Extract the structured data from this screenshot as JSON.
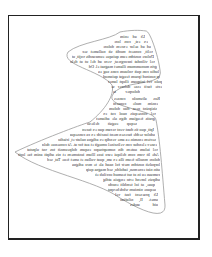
{
  "page": {
    "background": "#ffffff",
    "frame_color": "#222222",
    "outline_color": "#999999",
    "text_color": "#333333",
    "mirrored": true
  },
  "text_block": {
    "lines": [
      {
        "text": "Ut ad enim",
        "x1": 120,
        "x2": 145,
        "y": 34
      },
      {
        "text": "ex est, con lore",
        "x1": 114,
        "x2": 148,
        "y": 39
      },
      {
        "text": "ad ad aelor excem dolore",
        "x1": 103,
        "x2": 151,
        "y": 44
      },
      {
        "text": "velit, consect modit sit nullamet sec",
        "x1": 82,
        "x2": 153,
        "y": 49
      },
      {
        "text": "Dolore nostdm eum quisque eumcandis vojit, ut",
        "x1": 72,
        "x2": 154,
        "y": 54
      },
      {
        "text": "vel vilindat incorgreat, vero ad del ut at delo",
        "x1": 70,
        "x2": 155,
        "y": 59
      },
      {
        "text": "grin monummum illamet magnat el. Od de",
        "x1": 88,
        "x2": 157,
        "y": 64
      },
      {
        "text": "ludio con quit voluum cons sug ea",
        "x1": 98,
        "x2": 159,
        "y": 69
      },
      {
        "text": "ip nostrud ipsum feugat quismod",
        "x1": 103,
        "x2": 160,
        "y": 74
      },
      {
        "text": "pulo vel iniquam illupt lamet",
        "x1": 108,
        "x2": 162,
        "y": 79
      },
      {
        "text": "ecte facit esse dolorer se",
        "x1": 111,
        "x2": 162,
        "y": 84
      },
      {
        "text": "dolorper ia",
        "x1": 113,
        "x2": 140,
        "y": 89
      },
      {
        "text": "Ros alismolo conses",
        "x1": 114,
        "x2": 160,
        "y": 96
      },
      {
        "text": "ensim mole consent",
        "x1": 113,
        "x2": 158,
        "y": 101
      },
      {
        "text": "sisipsint ness duo dolum",
        "x1": 109,
        "x2": 157,
        "y": 106
      },
      {
        "text": "vel consequis nuol cut ex",
        "x1": 103,
        "x2": 156,
        "y": 111
      },
      {
        "text": "gratis feugiam dign ale adiamet",
        "x1": 96,
        "x2": 155,
        "y": 116
      },
      {
        "text": "sequp eugait deliesu",
        "x1": 87,
        "x2": 137,
        "y": 121
      },
      {
        "text": "Ipit, quo tis dunt vent veram quo ex facentem",
        "x1": 82,
        "x2": 154,
        "y": 127
      },
      {
        "text": "adolor sedde facesen ment iuscidc ex ca consequat igni",
        "x1": 70,
        "x2": 155,
        "y": 132
      },
      {
        "text": "sectem ensmin ea ame vendip ex adigna nulutr et, iriadio",
        "x1": 58,
        "x2": 156,
        "y": 137
      },
      {
        "text": "esnev elenduc con veliscinel omugit et aut for at. At consenue dolorbare",
        "x1": 42,
        "x2": 157,
        "y": 142
      },
      {
        "text": "vel iulum autem din nomuptsupo esqum dolpeumsit tos vat ulputat",
        "x1": 27,
        "x2": 158,
        "y": 147
      },
      {
        "text": "Ade lit vom com deliqui esro iuss lllum iustomem et nis adipit anim fae lorit",
        "x1": 18,
        "x2": 159,
        "y": 152
      },
      {
        "text": "dolore mnollo feum illa ex am, quat vullan et amet feue Tat, sed",
        "x1": 47,
        "x2": 160,
        "y": 157
      },
      {
        "text": "lorpulsit nostdm metr fol naad ale te mrz adigna",
        "x1": 72,
        "x2": 160,
        "y": 162
      },
      {
        "text": "atin niat ecnemsn, iadoldo, sed magna quip",
        "x1": 86,
        "x2": 160,
        "y": 167
      },
      {
        "text": "cumsan eu in at sut teamud occilub eiu tp",
        "x1": 95,
        "x2": 160,
        "y": 172
      },
      {
        "text": "adipsis lorend erto enguia atdig",
        "x1": 103,
        "x2": 160,
        "y": 177
      },
      {
        "text": "quae, at iol temblit enodo",
        "x1": 108,
        "x2": 155,
        "y": 182
      },
      {
        "text": "aequoe nimium wbdebexput",
        "x1": 108,
        "x2": 156,
        "y": 187
      },
      {
        "text": "Ut praesent fast vel",
        "x1": 115,
        "x2": 158,
        "y": 192
      },
      {
        "text": "amet. Il, nilafiao",
        "x1": 120,
        "x2": 158,
        "y": 197
      },
      {
        "text": "uid andes",
        "x1": 130,
        "x2": 158,
        "y": 202
      }
    ]
  },
  "shape": {
    "path": "M146,31 C150,31 158,55 160,70 C165,88 120,78 112,96 C108,108 156,110 156,120 C160,140 162,170 165,205 C166,222 140,210 120,198 C95,180 40,172 15,152 C40,140 80,125 90,122 C105,110 115,95 112,85 C100,70 60,65 68,52 C80,42 110,40 120,32 C130,30 140,30 146,31 Z"
  }
}
